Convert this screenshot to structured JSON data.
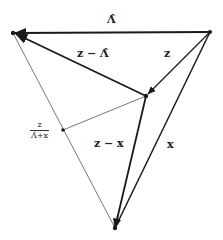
{
  "diagram": {
    "labels": {
      "top_edge": "Λ̂",
      "z_minus_lambda": "z − Λ̂",
      "z": "z",
      "z_minus_x": "z − x",
      "x": "x",
      "fraction_num": "z",
      "fraction_den": "Λ̂+x"
    },
    "vertices": {
      "top_left": [
        13,
        33
      ],
      "top_right": [
        210,
        32
      ],
      "interior": [
        146,
        96
      ],
      "bottom": [
        115,
        228
      ],
      "left_mid": [
        63,
        130
      ]
    },
    "colors": {
      "stroke": "#1a1a1a",
      "thin": "#555555",
      "background": "#ffffff"
    }
  }
}
